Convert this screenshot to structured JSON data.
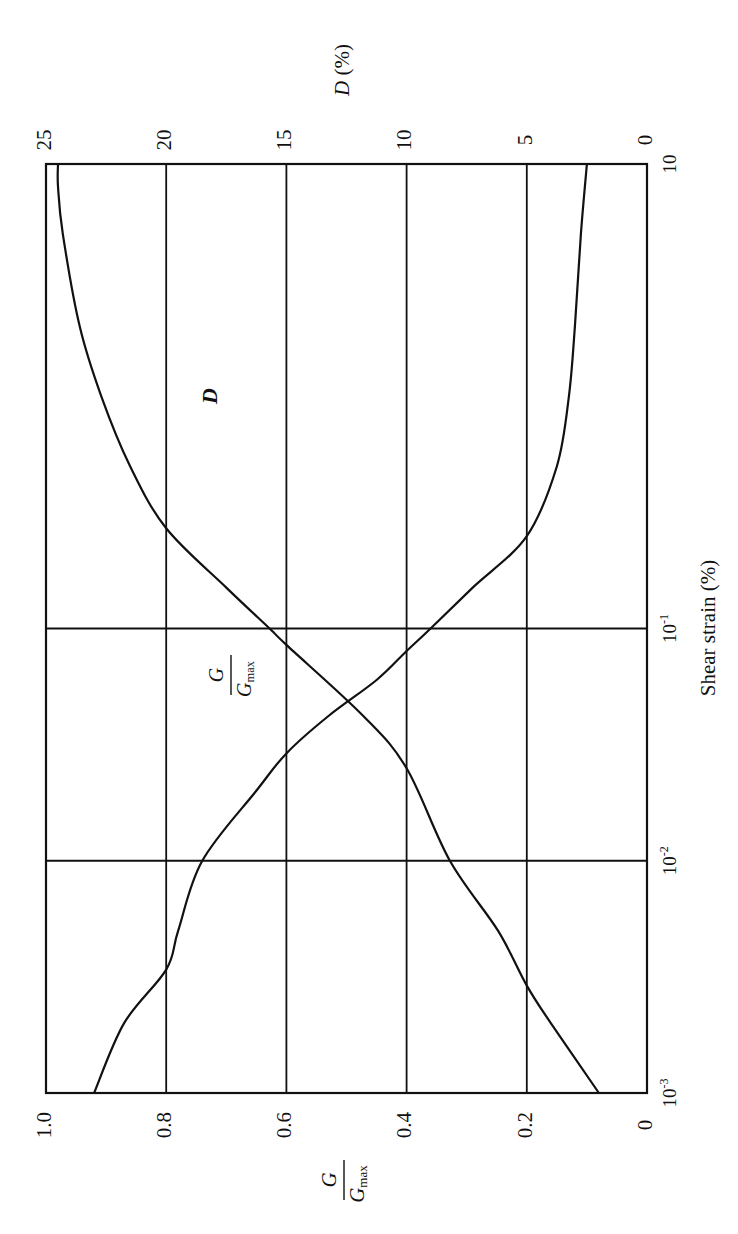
{
  "chart_data": {
    "type": "line",
    "orientation_note": "figure is printed rotated 90 degrees clockwise on the page",
    "title": "",
    "xlabel": "Shear strain (%)",
    "xscale": "log",
    "xlim": [
      0.001,
      10
    ],
    "x_ticks": [
      {
        "value": 0.001,
        "base": "10",
        "exp": "-3"
      },
      {
        "value": 0.01,
        "base": "10",
        "exp": "-2"
      },
      {
        "value": 0.1,
        "base": "10",
        "exp": "-1"
      },
      {
        "value": 10,
        "base": "10",
        "exp": ""
      }
    ],
    "ylabel_left": {
      "num": "G",
      "den": "G",
      "den_sub": "max"
    },
    "ylim_left": [
      0,
      1.0
    ],
    "y_ticks_left": [
      "0",
      "0.2",
      "0.4",
      "0.6",
      "0.8",
      "1.0"
    ],
    "ylabel_right": {
      "var": "D",
      "unit": " (%)"
    },
    "ylim_right": [
      0,
      25
    ],
    "y_ticks_right": [
      "0",
      "5",
      "10",
      "15",
      "20",
      "25"
    ],
    "grid": true,
    "series": [
      {
        "name": "G/Gmax",
        "axis": "left",
        "label": {
          "num": "G",
          "den": "G",
          "den_sub": "max"
        },
        "x": [
          0.001,
          0.002,
          0.0034,
          0.005,
          0.01,
          0.02,
          0.029,
          0.042,
          0.06,
          0.08,
          0.1,
          0.15,
          0.25,
          0.5,
          1,
          2,
          5,
          10
        ],
        "y": [
          0.92,
          0.87,
          0.8,
          0.78,
          0.74,
          0.65,
          0.6,
          0.53,
          0.45,
          0.4,
          0.36,
          0.29,
          0.2,
          0.15,
          0.13,
          0.12,
          0.11,
          0.1
        ]
      },
      {
        "name": "D",
        "axis": "right",
        "label": {
          "var": "D"
        },
        "x": [
          0.001,
          0.002,
          0.0029,
          0.005,
          0.01,
          0.025,
          0.042,
          0.085,
          0.1,
          0.15,
          0.27,
          0.5,
          1,
          2,
          5,
          8,
          10
        ],
        "y": [
          2.0,
          4.0,
          5.0,
          6.2,
          8.2,
          10.0,
          11.8,
          15.0,
          15.7,
          17.5,
          20.0,
          21.5,
          22.7,
          23.6,
          24.3,
          24.5,
          24.5
        ]
      }
    ],
    "annotations": [
      {
        "text": "D",
        "near_series": "D",
        "at_x": 0.35
      },
      {
        "text": "G/Gmax",
        "near_series": "G/Gmax",
        "at_x": 0.025
      }
    ]
  },
  "colors": {
    "line": "#111111",
    "background": "#ffffff"
  }
}
